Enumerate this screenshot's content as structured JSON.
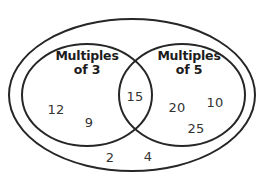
{
  "diagram": {
    "kind": "venn-diagram",
    "stroke_color": "#262626",
    "background_color": "#ffffff",
    "text_color": "#333333"
  },
  "universe": {
    "name": "universal-set",
    "elements": [
      {
        "value": "2",
        "x": 110,
        "y": 158
      },
      {
        "value": "4",
        "x": 148,
        "y": 157
      }
    ]
  },
  "sets": [
    {
      "id": "multiples-of-3",
      "title_line1": "Multiples",
      "title_line2": "of 3",
      "title_x": 87,
      "title_y": 55,
      "elements": [
        {
          "value": "12",
          "x": 56,
          "y": 110
        },
        {
          "value": "9",
          "x": 89,
          "y": 123
        }
      ]
    },
    {
      "id": "multiples-of-5",
      "title_line1": "Multiples",
      "title_line2": "of 5",
      "title_x": 189,
      "title_y": 55,
      "elements": [
        {
          "value": "20",
          "x": 177,
          "y": 108
        },
        {
          "value": "10",
          "x": 215,
          "y": 103
        },
        {
          "value": "25",
          "x": 196,
          "y": 129
        }
      ]
    }
  ],
  "intersection": {
    "id": "multiples-of-15",
    "elements": [
      {
        "value": "15",
        "x": 135,
        "y": 97
      }
    ]
  }
}
